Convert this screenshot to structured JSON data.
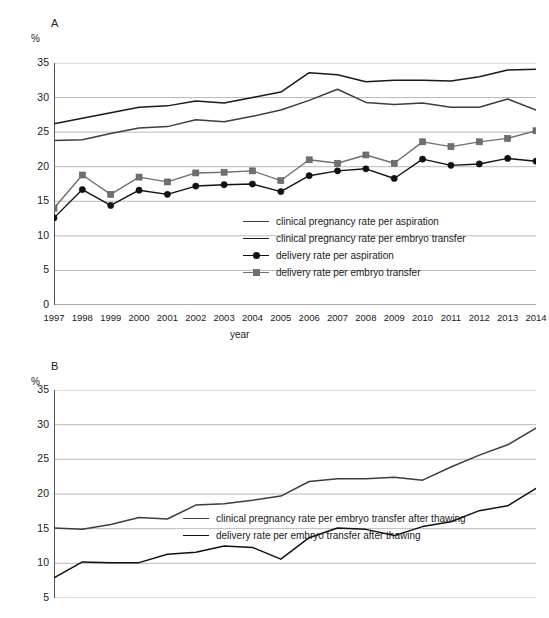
{
  "figure": {
    "background": "#ffffff",
    "panel_a_letter": "A",
    "panel_b_letter": "B"
  },
  "chart_data": [
    {
      "panel": "A",
      "type": "line",
      "title": "A",
      "xlabel": "year",
      "ylabel": "%",
      "ylim": [
        0,
        35
      ],
      "yticks": [
        0,
        5,
        10,
        15,
        20,
        25,
        30,
        35
      ],
      "grid": true,
      "legend_position": "inside-lower-right",
      "categories": [
        "1997",
        "1998",
        "1999",
        "2000",
        "2001",
        "2002",
        "2003",
        "2004",
        "2005",
        "2006",
        "2007",
        "2008",
        "2009",
        "2010",
        "2011",
        "2012",
        "2013",
        "2014"
      ],
      "series": [
        {
          "name": "clinical pregnancy rate per aspiration",
          "color": "#3d3d3d",
          "marker": "none",
          "values": [
            23.8,
            23.9,
            24.8,
            25.6,
            25.8,
            26.8,
            26.5,
            27.3,
            28.2,
            29.6,
            31.2,
            29.3,
            29.0,
            29.2,
            28.6,
            28.6,
            29.8,
            28.2
          ]
        },
        {
          "name": "clinical pregnancy rate per embryo transfer",
          "color": "#1a1a1a",
          "marker": "none",
          "values": [
            26.2,
            27.0,
            27.8,
            28.6,
            28.8,
            29.5,
            29.2,
            30.0,
            30.8,
            33.6,
            33.3,
            32.3,
            32.5,
            32.5,
            32.4,
            33.0,
            34.0,
            34.1
          ]
        },
        {
          "name": "delivery rate per aspiration",
          "color": "#111111",
          "marker": "circle",
          "values": [
            12.6,
            16.7,
            14.4,
            16.6,
            16.0,
            17.2,
            17.4,
            17.5,
            16.4,
            18.7,
            19.4,
            19.7,
            18.3,
            21.1,
            20.2,
            20.4,
            21.2,
            20.8
          ]
        },
        {
          "name": "delivery rate per embryo transfer",
          "color": "#707070",
          "marker": "square",
          "values": [
            14.0,
            18.8,
            16.0,
            18.5,
            17.8,
            19.1,
            19.2,
            19.4,
            18.0,
            21.0,
            20.5,
            21.7,
            20.5,
            23.6,
            22.9,
            23.6,
            24.1,
            25.2
          ]
        }
      ]
    },
    {
      "panel": "B",
      "type": "line",
      "title": "B",
      "xlabel": "",
      "ylabel": "%",
      "ylim": [
        5,
        35
      ],
      "yticks": [
        5,
        10,
        15,
        20,
        25,
        30,
        35
      ],
      "grid": true,
      "legend_position": "inside-lower-right",
      "categories": [
        "1997",
        "1998",
        "1999",
        "2000",
        "2001",
        "2002",
        "2003",
        "2004",
        "2005",
        "2006",
        "2007",
        "2008",
        "2009",
        "2010",
        "2011",
        "2012",
        "2013",
        "2014"
      ],
      "series": [
        {
          "name": "clinical pregnancy rate per embryo transfer after thawing",
          "color": "#3d3d3d",
          "marker": "none",
          "values": [
            15.1,
            14.9,
            15.6,
            16.6,
            16.4,
            18.4,
            18.6,
            19.1,
            19.7,
            21.8,
            22.2,
            22.2,
            22.4,
            22.0,
            23.9,
            25.6,
            27.1,
            29.5
          ]
        },
        {
          "name": "delivery rate per embryo transfer after thawing",
          "color": "#111111",
          "marker": "none",
          "values": [
            7.9,
            10.2,
            10.1,
            10.1,
            11.3,
            11.6,
            12.5,
            12.3,
            10.6,
            13.7,
            15.1,
            14.9,
            14.0,
            15.3,
            16.0,
            17.6,
            18.3,
            20.8
          ]
        }
      ]
    }
  ]
}
